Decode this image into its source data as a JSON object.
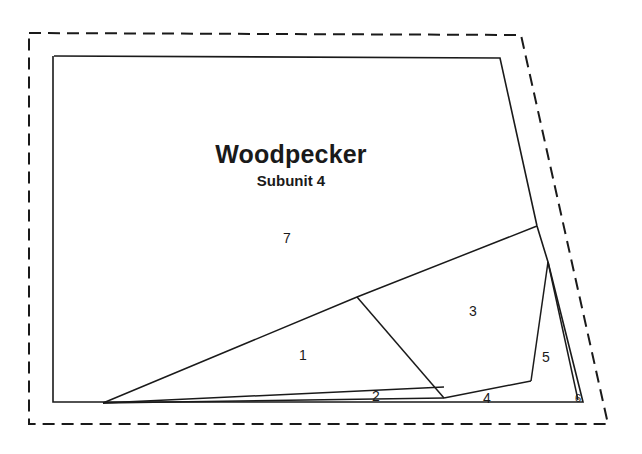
{
  "figure": {
    "name": "management-unit-subunit-map",
    "width": 642,
    "height": 454,
    "background_color": "#ffffff",
    "line_color": "#1a1a1a"
  },
  "title": {
    "text": "Woodpecker",
    "x": 291,
    "y": 163
  },
  "subtitle": {
    "text": "Subunit 4",
    "x": 291,
    "y": 186
  },
  "boundaries": {
    "outer_dashed": {
      "name": "project-area-dashed-boundary",
      "style": "dashed",
      "dash_pattern": "12 7",
      "points": "29,33 521,35 608,424 29,424 29,33"
    },
    "inner_solid": {
      "name": "subunit-solid-boundary",
      "style": "solid",
      "points": "54,56 500,58 537,226 548,262 583,402 53,402 53,56"
    }
  },
  "dividers": [
    {
      "name": "divider-stand7-lower",
      "points": "103,403 357,297 537,226"
    },
    {
      "name": "divider-stand1-stand3",
      "points": "357,297 444,398"
    },
    {
      "name": "divider-stand2-top",
      "points": "103,403 444,387"
    },
    {
      "name": "divider-stand2-bottom",
      "points": "103,403 444,398"
    },
    {
      "name": "divider-stand4-upper",
      "points": "444,398 531,381"
    },
    {
      "name": "divider-stand5-left",
      "points": "531,381 548,262"
    },
    {
      "name": "divider-stand6-left",
      "points": "548,262 578,400"
    }
  ],
  "region_labels": [
    {
      "id": "1",
      "text": "1",
      "x": 303,
      "y": 360,
      "size": "normal"
    },
    {
      "id": "2",
      "text": "2",
      "x": 376,
      "y": 401,
      "size": "normal"
    },
    {
      "id": "3",
      "text": "3",
      "x": 473,
      "y": 316,
      "size": "normal"
    },
    {
      "id": "4",
      "text": "4",
      "x": 487,
      "y": 403,
      "size": "normal"
    },
    {
      "id": "5",
      "text": "5",
      "x": 546,
      "y": 362,
      "size": "normal"
    },
    {
      "id": "6",
      "text": "6",
      "x": 578,
      "y": 401,
      "size": "tiny"
    },
    {
      "id": "7",
      "text": "7",
      "x": 287,
      "y": 243,
      "size": "normal"
    }
  ]
}
